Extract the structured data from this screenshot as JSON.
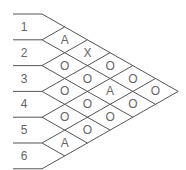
{
  "diagram": {
    "row_labels": [
      "1",
      "2",
      "3",
      "4",
      "5",
      "6"
    ],
    "columns": [
      [
        "A",
        "O",
        "O",
        "O",
        "A"
      ],
      [
        "X",
        "O",
        "O",
        "O"
      ],
      [
        "O",
        "A",
        "O"
      ],
      [
        "O",
        "O"
      ],
      [
        "O"
      ]
    ],
    "line_color": "#555555",
    "text_color": "#666666"
  }
}
